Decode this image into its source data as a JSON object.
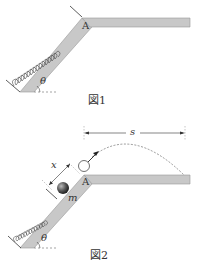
{
  "figure1": {
    "caption": "図1",
    "point_label": "A",
    "angle_label": "θ"
  },
  "figure2": {
    "caption": "図2",
    "point_label": "A",
    "angle_label": "θ",
    "mass_label": "m",
    "compression_label": "x",
    "distance_label": "s"
  },
  "colors": {
    "surface": "#c8c8c8",
    "surface_edge": "#999999",
    "line": "#333333",
    "ball": "#555555"
  }
}
